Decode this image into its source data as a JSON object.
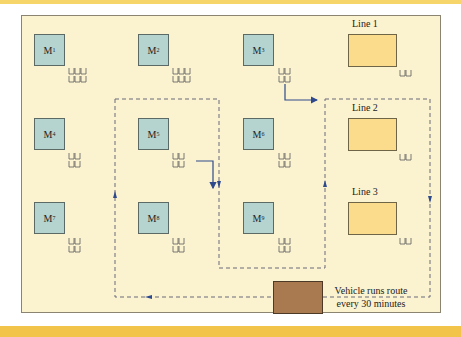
{
  "machines": [
    {
      "id": "M1",
      "letter": "M",
      "sub": "1"
    },
    {
      "id": "M2",
      "letter": "M",
      "sub": "2"
    },
    {
      "id": "M3",
      "letter": "M",
      "sub": "3"
    },
    {
      "id": "M4",
      "letter": "M",
      "sub": "4"
    },
    {
      "id": "M5",
      "letter": "M",
      "sub": "5"
    },
    {
      "id": "M6",
      "letter": "M",
      "sub": "6"
    },
    {
      "id": "M7",
      "letter": "M",
      "sub": "7"
    },
    {
      "id": "M8",
      "letter": "M",
      "sub": "8"
    },
    {
      "id": "M9",
      "letter": "M",
      "sub": "9"
    }
  ],
  "lines": [
    {
      "label": "Line 1"
    },
    {
      "label": "Line 2"
    },
    {
      "label": "Line 3"
    }
  ],
  "vehicle_note": {
    "line1": "Vehicle runs route",
    "line2": "every 30 minutes"
  },
  "colors": {
    "machine_fill": "#b6d4cf",
    "line_fill": "#fbdc8d",
    "vehicle_fill": "#a97a4f",
    "background": "#fbf2cf",
    "route": "#6a6a7a",
    "arrow": "#2e4a8c",
    "accent_bar": "#f3c44a"
  }
}
